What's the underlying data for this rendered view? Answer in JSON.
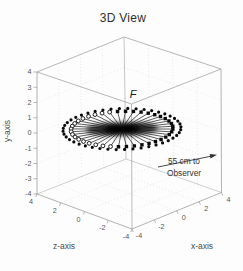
{
  "figure": {
    "title": "3D View"
  },
  "labels": {
    "title": "3D View",
    "focus_marker": "F",
    "annotation_line1": "55 cm to",
    "annotation_line2": "Observer",
    "x_axis": "x-axis",
    "y_axis": "y-axis",
    "z_axis": "z-axis"
  },
  "colors": {
    "paper": "#fdfdfd",
    "box_edge": "#9b9b9b",
    "hidden_edge": "#a8a8a8",
    "grid_dot": "#ababab",
    "tick_text": "#555555",
    "axis_label_text": "#4a4a4a",
    "title_text": "#2e2e2e",
    "data_ink": "#0a0a0a",
    "annotation_ink": "#333333"
  },
  "chart_data": {
    "type": "scatter",
    "projection": "3d",
    "title": "3D View",
    "axes": {
      "x": {
        "label": "x-axis",
        "lim": [
          -4,
          4
        ],
        "ticks": [
          -4,
          -2,
          0,
          2,
          4
        ]
      },
      "y": {
        "label": "y-axis",
        "lim": [
          -4,
          4
        ],
        "ticks": [
          4,
          3,
          2,
          1,
          0,
          -1,
          -2,
          -3,
          -4
        ]
      },
      "z": {
        "label": "z-axis",
        "lim": [
          4,
          -4
        ],
        "ticks": [
          4,
          2,
          0,
          -2,
          -4
        ]
      }
    },
    "grid": true,
    "legend": false,
    "series": [
      {
        "name": "outer-dot-ring",
        "marker": "filled-circle",
        "count": 44,
        "plane": "y=0",
        "ring_radius": 4,
        "center": [
          0,
          0,
          0
        ]
      },
      {
        "name": "spoke-fan",
        "description": "lines radiating from origin to a ring of markers in the y=0 plane",
        "count": 40,
        "ring_radius_fraction": 0.865,
        "marker_right_side": "filled-square",
        "marker_left_side": "open-circle",
        "open_marker_screen_angle_range_deg": [
          95,
          263
        ]
      }
    ],
    "annotations": [
      {
        "text": "F",
        "style": "italic",
        "location": "above top-front box corner"
      },
      {
        "text_lines": [
          "55 cm to",
          "Observer"
        ],
        "arrow": true,
        "arrow_points": "right, toward observer"
      }
    ]
  }
}
